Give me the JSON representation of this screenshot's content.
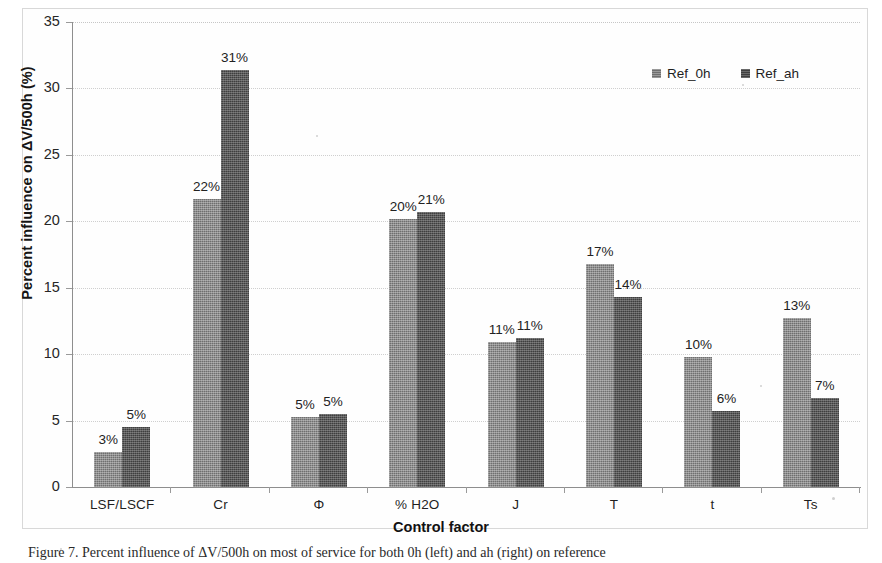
{
  "chart_data": {
    "type": "bar",
    "title": "",
    "subtitle": "",
    "xlabel": "Control factor",
    "ylabel": "Percent influence on ΔV/500h (%)",
    "ylim": [
      0,
      35
    ],
    "yticks": [
      0,
      5,
      10,
      15,
      20,
      25,
      30,
      35
    ],
    "grid": "horizontal-dotted",
    "legend_position": "top-right",
    "categories": [
      "LSF/LSCF",
      "Cr",
      "Φ",
      "% H2O",
      "J",
      "T",
      "t",
      "Ts"
    ],
    "series": [
      {
        "name": "Ref_0h",
        "color": "#6f6f6f",
        "values": [
          2.6,
          21.7,
          5.3,
          20.2,
          10.9,
          16.8,
          9.8,
          12.7
        ],
        "data_labels": [
          "3%",
          "22%",
          "5%",
          "20%",
          "11%",
          "17%",
          "10%",
          "13%"
        ]
      },
      {
        "name": "Ref_ah",
        "color": "#3f3f3f",
        "values": [
          4.5,
          31.4,
          5.5,
          20.7,
          11.2,
          14.3,
          5.7,
          6.7
        ],
        "data_labels": [
          "5%",
          "31%",
          "5%",
          "21%",
          "11%",
          "14%",
          "6%",
          "7%"
        ]
      }
    ]
  },
  "caption": {
    "text": "Figure 7. Percent influence of ΔV/500h on most of service for both 0h (left) and ah (right) on reference"
  }
}
